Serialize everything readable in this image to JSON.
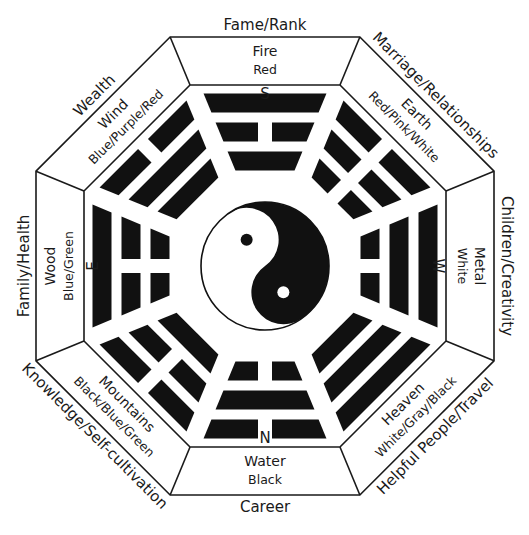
{
  "colors": {
    "ink": "#111111",
    "paper": "#ffffff"
  },
  "center": {
    "symbol": "yin-yang-icon"
  },
  "sectors": [
    {
      "id": "south",
      "direction": "S",
      "life_area": "Fame/Rank",
      "element": "Fire",
      "colors": "Red",
      "trigram": [
        "solid",
        "broken",
        "solid"
      ]
    },
    {
      "id": "southwest",
      "direction": "",
      "life_area": "Marriage/Relationships",
      "element": "Earth",
      "colors": "Red/Pink/White",
      "trigram": [
        "broken",
        "broken",
        "broken"
      ]
    },
    {
      "id": "west",
      "direction": "W",
      "life_area": "Children/Creativity",
      "element": "Metal",
      "colors": "White",
      "trigram": [
        "solid",
        "solid",
        "broken"
      ]
    },
    {
      "id": "northwest",
      "direction": "",
      "life_area": "Helpful People/Travel",
      "element": "Heaven",
      "colors": "White/Gray/Black",
      "trigram": [
        "solid",
        "solid",
        "solid"
      ]
    },
    {
      "id": "north",
      "direction": "N",
      "life_area": "Career",
      "element": "Water",
      "colors": "Black",
      "trigram": [
        "broken",
        "solid",
        "broken"
      ]
    },
    {
      "id": "northeast",
      "direction": "",
      "life_area": "Knowledge/Self-cultivation",
      "element": "Mountains",
      "colors": "Black/Blue/Green",
      "trigram": [
        "broken",
        "broken",
        "solid"
      ]
    },
    {
      "id": "east",
      "direction": "E",
      "life_area": "Family/Health",
      "element": "Wood",
      "colors": "Blue/Green",
      "trigram": [
        "solid",
        "broken",
        "broken"
      ]
    },
    {
      "id": "southeast",
      "direction": "",
      "life_area": "Wealth",
      "element": "Wind",
      "colors": "Blue/Purple/Red",
      "trigram": [
        "broken",
        "solid",
        "solid"
      ]
    }
  ],
  "trigram_order_note": "trigram lines listed outer → inner (outer = nearest the octagon rim)"
}
